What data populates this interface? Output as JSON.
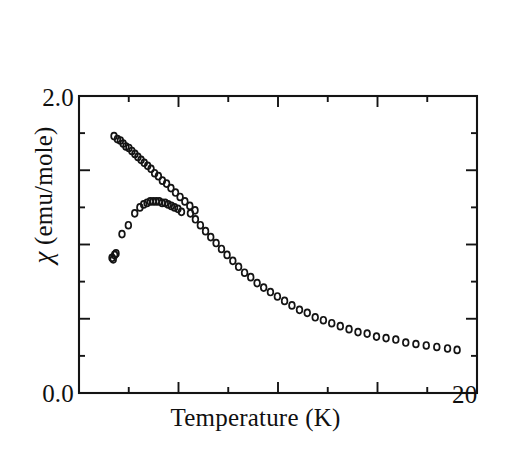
{
  "figure": {
    "background_color": "#ffffff",
    "ink_color": "#141414"
  },
  "axes": {
    "y_title": "χ (emu/mole)",
    "y_title_symbol": "χ",
    "y_title_rest": " (emu/mole)",
    "x_title": "Temperature (K)",
    "y_tick_top_label": "2.0",
    "y_tick_bottom_label": "0.0",
    "x_tick_right_label": "20"
  },
  "chart_data": {
    "type": "scatter",
    "title": "",
    "xlabel": "Temperature (K)",
    "ylabel": "χ (emu/mole)",
    "xlim": [
      0,
      20
    ],
    "ylim": [
      0,
      2.0
    ],
    "xticks": [
      0,
      2.5,
      5,
      7.5,
      10,
      12.5,
      15,
      17.5,
      20
    ],
    "xtick_labels": [
      "",
      "",
      "",
      "",
      "",
      "",
      "",
      "",
      "20"
    ],
    "yticks": [
      0,
      0.25,
      0.5,
      0.75,
      1.0,
      1.25,
      1.5,
      1.75,
      2.0
    ],
    "ytick_labels": [
      "0.0",
      "",
      "",
      "",
      "",
      "",
      "",
      "",
      "2.0"
    ],
    "grid": false,
    "legend": "none",
    "marker": "open-circle",
    "marker_size_px": 5,
    "series": [
      {
        "name": "upper-branch",
        "marker": "open-circle",
        "x": [
          1.76,
          1.93,
          2.08,
          2.22,
          2.36,
          2.51,
          2.66,
          2.81,
          2.96,
          3.12,
          3.28,
          3.45,
          3.62,
          3.8,
          3.99,
          4.19,
          4.4,
          4.62,
          4.85,
          5.08,
          5.32,
          5.57,
          5.83
        ],
        "y": [
          1.73,
          1.71,
          1.7,
          1.68,
          1.66,
          1.65,
          1.63,
          1.61,
          1.59,
          1.57,
          1.55,
          1.53,
          1.51,
          1.48,
          1.46,
          1.43,
          1.41,
          1.38,
          1.35,
          1.32,
          1.29,
          1.26,
          1.23
        ]
      },
      {
        "name": "lower-branch",
        "marker": "open-circle",
        "x": [
          1.66,
          1.72,
          1.79,
          1.86,
          2.16,
          2.48,
          2.8,
          3.06,
          3.25,
          3.42,
          3.58,
          3.73,
          3.88,
          4.03,
          4.18,
          4.33,
          4.48,
          4.64,
          4.8,
          4.97,
          5.15
        ],
        "y": [
          0.91,
          0.9,
          0.93,
          0.94,
          1.07,
          1.13,
          1.21,
          1.25,
          1.27,
          1.28,
          1.29,
          1.29,
          1.29,
          1.29,
          1.28,
          1.28,
          1.27,
          1.26,
          1.25,
          1.24,
          1.22
        ]
      },
      {
        "name": "merged-tail",
        "marker": "open-circle",
        "x": [
          5.6,
          5.85,
          6.1,
          6.36,
          6.62,
          6.89,
          7.16,
          7.44,
          7.73,
          8.02,
          8.32,
          8.63,
          8.95,
          9.28,
          9.62,
          9.97,
          10.33,
          10.7,
          11.08,
          11.47,
          11.87,
          12.28,
          12.7,
          13.13,
          13.57,
          14.02,
          14.48,
          14.95,
          15.43,
          15.92,
          16.42,
          16.93,
          17.45,
          17.98,
          18.52,
          19.0
        ],
        "y": [
          1.21,
          1.17,
          1.13,
          1.09,
          1.05,
          1.01,
          0.97,
          0.93,
          0.89,
          0.85,
          0.81,
          0.78,
          0.74,
          0.71,
          0.68,
          0.65,
          0.62,
          0.59,
          0.56,
          0.54,
          0.51,
          0.49,
          0.47,
          0.45,
          0.43,
          0.41,
          0.4,
          0.38,
          0.37,
          0.36,
          0.34,
          0.33,
          0.32,
          0.31,
          0.3,
          0.29
        ]
      }
    ]
  }
}
